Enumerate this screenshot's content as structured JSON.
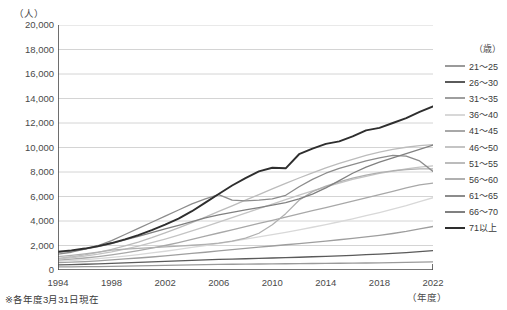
{
  "header": {
    "cut_title": "",
    "y_unit": "（人）",
    "x_unit": "（年度）",
    "note": "※各年度3月31日現在",
    "legend_header": "（歳）"
  },
  "chart_data": {
    "type": "line",
    "title": "",
    "xlabel": "（年度）",
    "ylabel": "（人）",
    "ylim": [
      0,
      20000
    ],
    "ytick_step": 2000,
    "ytick_labels": [
      "20,000",
      "18,000",
      "16,000",
      "14,000",
      "12,000",
      "10,000",
      "8,000",
      "6,000",
      "4,000",
      "2,000",
      "0"
    ],
    "ytick_values": [
      20000,
      18000,
      16000,
      14000,
      12000,
      10000,
      8000,
      6000,
      4000,
      2000,
      0
    ],
    "grid": true,
    "legend_position": "right",
    "x": [
      1994,
      1995,
      1996,
      1997,
      1998,
      1999,
      2000,
      2001,
      2002,
      2003,
      2004,
      2005,
      2006,
      2007,
      2008,
      2009,
      2010,
      2011,
      2012,
      2013,
      2014,
      2015,
      2016,
      2017,
      2018,
      2019,
      2020,
      2021,
      2022
    ],
    "xtick_labels": [
      "1994",
      "1998",
      "2002",
      "2006",
      "2010",
      "2014",
      "2018",
      "2022"
    ],
    "xtick_values": [
      1994,
      1998,
      2002,
      2006,
      2010,
      2014,
      2018,
      2022
    ],
    "series": [
      {
        "name": "21〜25",
        "color": "#9a9a9a",
        "values": [
          250,
          260,
          270,
          280,
          300,
          320,
          340,
          360,
          380,
          400,
          420,
          440,
          460,
          470,
          480,
          490,
          500,
          510,
          520,
          530,
          540,
          550,
          560,
          570,
          580,
          600,
          620,
          640,
          660
        ]
      },
      {
        "name": "26〜30",
        "color": "#5a5a5a",
        "values": [
          420,
          440,
          470,
          500,
          540,
          580,
          620,
          660,
          700,
          740,
          780,
          820,
          860,
          890,
          920,
          950,
          980,
          1010,
          1040,
          1080,
          1120,
          1160,
          1200,
          1250,
          1300,
          1360,
          1420,
          1500,
          1580
        ]
      },
      {
        "name": "31〜35",
        "color": "#9e9e9e",
        "values": [
          600,
          640,
          690,
          750,
          820,
          900,
          980,
          1060,
          1150,
          1250,
          1350,
          1450,
          1560,
          1660,
          1760,
          1860,
          1960,
          2060,
          2160,
          2260,
          2360,
          2470,
          2580,
          2700,
          2830,
          2980,
          3150,
          3350,
          3550
        ]
      },
      {
        "name": "36〜40",
        "color": "#d8d8d8",
        "values": [
          700,
          760,
          840,
          930,
          1030,
          1140,
          1260,
          1390,
          1530,
          1680,
          1840,
          2000,
          2170,
          2340,
          2520,
          2700,
          2890,
          3080,
          3280,
          3490,
          3710,
          3940,
          4180,
          4430,
          4690,
          4970,
          5260,
          5580,
          5900
        ]
      },
      {
        "name": "41〜45",
        "color": "#a8a8a8",
        "values": [
          800,
          880,
          980,
          1100,
          1240,
          1400,
          1580,
          1780,
          2000,
          2240,
          2500,
          2760,
          3020,
          3280,
          3540,
          3800,
          4060,
          4320,
          4580,
          4840,
          5100,
          5360,
          5620,
          5880,
          6150,
          6420,
          6700,
          6950,
          7100
        ]
      },
      {
        "name": "46〜50",
        "color": "#c4c4c4",
        "values": [
          900,
          1000,
          1130,
          1290,
          1480,
          1700,
          1950,
          2230,
          2530,
          2850,
          3190,
          3540,
          3900,
          4270,
          4640,
          5010,
          5380,
          5750,
          6110,
          6460,
          6790,
          7100,
          7390,
          7650,
          7880,
          8080,
          8250,
          8400,
          8500
        ]
      },
      {
        "name": "51〜55",
        "color": "#bcbcbc",
        "values": [
          950,
          1080,
          1240,
          1440,
          1680,
          1960,
          2280,
          2640,
          3030,
          3440,
          3870,
          4320,
          4780,
          5240,
          5700,
          6160,
          6620,
          7070,
          7510,
          7930,
          8330,
          8700,
          9040,
          9350,
          9620,
          9850,
          10020,
          10150,
          10230
        ]
      },
      {
        "name": "56〜60",
        "color": "#b0b0b0",
        "values": [
          1100,
          1200,
          1320,
          1460,
          1620,
          1700,
          1760,
          1820,
          1880,
          1950,
          2020,
          2100,
          2200,
          2350,
          2600,
          3000,
          3700,
          4600,
          5700,
          6400,
          6850,
          7200,
          7500,
          7750,
          7950,
          8100,
          8200,
          8250,
          8250
        ]
      },
      {
        "name": "61〜65",
        "color": "#8c8c8c",
        "values": [
          1300,
          1450,
          1700,
          2000,
          2400,
          2900,
          3400,
          3900,
          4400,
          4900,
          5400,
          5800,
          6150,
          5700,
          5650,
          5700,
          5800,
          6100,
          6800,
          7400,
          7900,
          8300,
          8600,
          8900,
          9150,
          9350,
          9300,
          8900,
          8050
        ]
      },
      {
        "name": "66〜70",
        "color": "#808080",
        "values": [
          1450,
          1550,
          1700,
          1900,
          2150,
          2450,
          2750,
          3050,
          3350,
          3650,
          3950,
          4250,
          4500,
          4700,
          4900,
          5100,
          5300,
          5500,
          5800,
          6200,
          6700,
          7300,
          7900,
          8400,
          8800,
          9150,
          9500,
          9850,
          10200
        ]
      },
      {
        "name": "71以上",
        "color": "#2e2e2e",
        "values": [
          1500,
          1600,
          1750,
          1950,
          2200,
          2500,
          2850,
          3250,
          3700,
          4200,
          4800,
          5500,
          6200,
          6900,
          7500,
          8050,
          8350,
          8300,
          9450,
          9900,
          10300,
          10500,
          10900,
          11400,
          11600,
          12000,
          12400,
          12900,
          13350
        ]
      }
    ]
  }
}
